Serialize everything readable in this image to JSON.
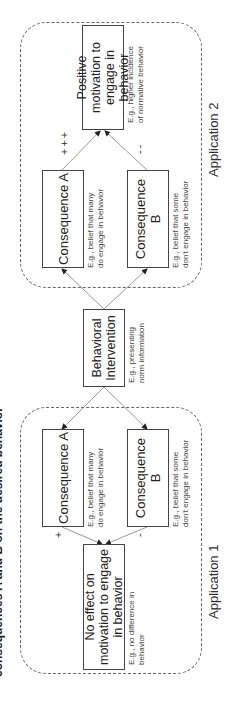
{
  "figure": {
    "title": "consequences A and B on the desired behavior",
    "orientation": "rotated-90-clockwise"
  },
  "center": {
    "intervention": {
      "label": "Behavioral Intervention",
      "note": "E.g., presenting\nnorm information"
    }
  },
  "application1": {
    "label": "Application 1",
    "consequence_a": {
      "label": "Consequence A",
      "note": "E.g., belief that many\ndo engage in behavior",
      "sign": "+"
    },
    "consequence_b": {
      "label": "Consequence B",
      "note": "E.g., belief that some\ndon't engage in behavior",
      "sign": "-"
    },
    "outcome": {
      "label": "No effect on motivation to engage in behavior",
      "note": "E.g., no difference in\nbehavior"
    }
  },
  "application2": {
    "label": "Application 2",
    "consequence_a": {
      "label": "Consequence A",
      "note": "E.g., belief that many\ndo engage in behavior",
      "sign": "+++"
    },
    "consequence_b": {
      "label": "Consequence B",
      "note": "E.g., belief that some\ndon't engage in behavior",
      "sign": "--"
    },
    "outcome": {
      "label": "Positive motivation to engage in behavior",
      "note": "E.g., higher incidence\nof normative behavior"
    }
  },
  "colors": {
    "line": "#999999",
    "border": "#444444",
    "dashed": "#666666",
    "text": "#222222"
  }
}
